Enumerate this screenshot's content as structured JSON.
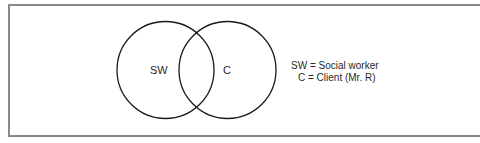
{
  "diagram": {
    "type": "venn",
    "sets": [
      {
        "id": "SW",
        "label": "SW",
        "cx": 165.5,
        "cy": 70,
        "r": 48.5
      },
      {
        "id": "C",
        "label": "C",
        "cx": 227.5,
        "cy": 70,
        "r": 48.5
      }
    ],
    "legend": [
      {
        "text": "SW = Social worker"
      },
      {
        "text": "C = Client (Mr. R)"
      }
    ],
    "colors": {
      "stroke": "#1a1a1a",
      "frame": "#8a8a8a",
      "text": "#2a2a2a"
    }
  }
}
